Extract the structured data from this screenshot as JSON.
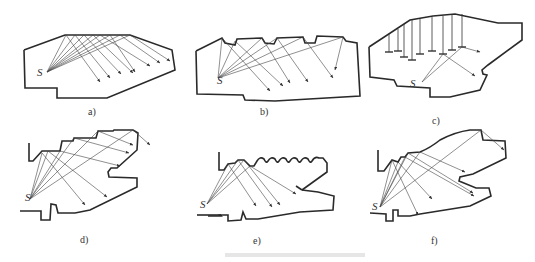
{
  "figure": {
    "panels": [
      {
        "id": "a",
        "label": "a)",
        "source_label": "S",
        "description": "hall with flat polygonal ceiling reflecting rays"
      },
      {
        "id": "b",
        "label": "b)",
        "source_label": "S",
        "description": "sawtooth ceiling reflecting rays toward rear"
      },
      {
        "id": "c",
        "label": "c)",
        "source_label": "S",
        "description": "ceiling with suspended reflector panels"
      },
      {
        "id": "d",
        "label": "d)",
        "source_label": "S",
        "description": "stepped ceiling with balcony"
      },
      {
        "id": "e",
        "label": "e)",
        "source_label": "S",
        "description": "scalloped ceiling with balcony"
      },
      {
        "id": "f",
        "label": "f)",
        "source_label": "S",
        "description": "curved ceiling with two balconies"
      }
    ],
    "caption": ""
  }
}
